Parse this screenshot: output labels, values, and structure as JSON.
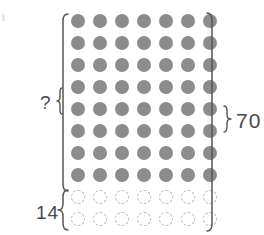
{
  "figure": {
    "background_color": "#ffffff",
    "labels": {
      "unknown": "?",
      "missing": "14",
      "total": "70"
    },
    "colors": {
      "filled_dot": "#8c8c8c",
      "ghost_dot_stroke": "#b9b9b9",
      "bracket_stroke": "#555555",
      "text": "#4a4a4a"
    },
    "icons": {
      "left_bracket": "left-square-bracket",
      "right_bracket": "right-square-bracket",
      "unknown_brace": "left-curly-brace",
      "missing_brace": "left-curly-brace",
      "total_brace": "right-curly-brace"
    }
  },
  "chart_data": {
    "type": "table",
    "columns": 7,
    "rows": 10,
    "groups": [
      {
        "name": "present",
        "label": "?",
        "style": "filled",
        "rows": 8,
        "columns": 7,
        "count": 56,
        "color": "#8c8c8c"
      },
      {
        "name": "missing",
        "label": "14",
        "style": "dashed-outline",
        "rows": 2,
        "columns": 7,
        "count": 14,
        "color": "#b9b9b9"
      }
    ],
    "total": {
      "label": "70",
      "value": 70
    },
    "annotations": [
      {
        "text": "?",
        "position": "left",
        "spans_rows": 8,
        "meaning": "unknown number of filled circles"
      },
      {
        "text": "14",
        "position": "left",
        "spans_rows": 2,
        "meaning": "number of dashed (missing) circles"
      },
      {
        "text": "70",
        "position": "right",
        "spans_rows": 10,
        "meaning": "total number of circles"
      }
    ],
    "grid": false,
    "legend": "none"
  },
  "rows": [
    {
      "style": "filled",
      "dots": 7
    },
    {
      "style": "filled",
      "dots": 7
    },
    {
      "style": "filled",
      "dots": 7
    },
    {
      "style": "filled",
      "dots": 7
    },
    {
      "style": "filled",
      "dots": 7
    },
    {
      "style": "filled",
      "dots": 7
    },
    {
      "style": "filled",
      "dots": 7
    },
    {
      "style": "filled",
      "dots": 7
    },
    {
      "style": "ghost",
      "dots": 7
    },
    {
      "style": "ghost",
      "dots": 7
    }
  ]
}
